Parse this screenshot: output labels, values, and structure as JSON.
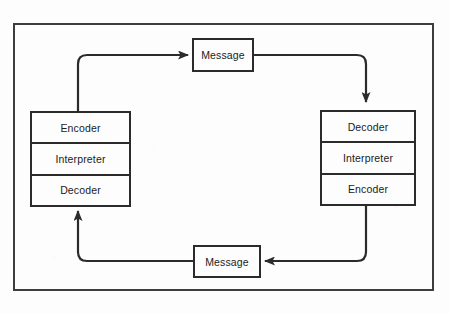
{
  "diagram": {
    "colors": {
      "line": "#2b2b2b",
      "frame": "#3d3d3d",
      "background": "#fdfdfd",
      "text": "#1b1b1b"
    },
    "left_agent": {
      "name": "left-agent-stack",
      "rows": [
        {
          "label": "Encoder"
        },
        {
          "label": "Interpreter"
        },
        {
          "label": "Decoder"
        }
      ]
    },
    "right_agent": {
      "name": "right-agent-stack",
      "rows": [
        {
          "label": "Decoder"
        },
        {
          "label": "Interpreter"
        },
        {
          "label": "Encoder"
        }
      ]
    },
    "messages": {
      "top": {
        "label": "Message"
      },
      "bottom": {
        "label": "Message"
      }
    },
    "connectors": [
      {
        "name": "left-to-top-message",
        "direction": "right",
        "from": "left-agent-top",
        "to": "message-top"
      },
      {
        "name": "top-message-to-right",
        "direction": "down",
        "from": "message-top",
        "to": "right-agent-top"
      },
      {
        "name": "right-to-bottom-message",
        "direction": "left",
        "from": "right-agent-bottom",
        "to": "message-bottom"
      },
      {
        "name": "bottom-message-to-left",
        "direction": "up",
        "from": "message-bottom",
        "to": "left-agent-bottom"
      }
    ]
  }
}
